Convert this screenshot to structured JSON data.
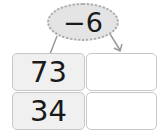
{
  "operator": {
    "label": "−6"
  },
  "table": {
    "rows": [
      {
        "input": "73",
        "output": ""
      },
      {
        "input": "34",
        "output": ""
      }
    ]
  },
  "colors": {
    "ellipse_fill": "#e4e4e4",
    "ellipse_border": "#a8a8a8",
    "given_fill": "#f0f0f0",
    "border": "#c8c8c8"
  }
}
